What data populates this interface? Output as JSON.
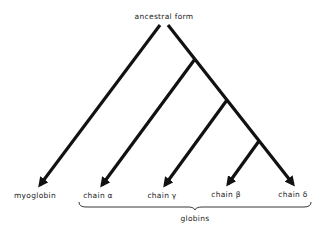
{
  "diagram": {
    "type": "phylogenetic-tree",
    "root": {
      "label": "ancestral form"
    },
    "leaves": [
      {
        "id": "myoglobin",
        "label": "myoglobin"
      },
      {
        "id": "alpha",
        "label": "chain α"
      },
      {
        "id": "gamma",
        "label": "chain γ"
      },
      {
        "id": "beta",
        "label": "chain β"
      },
      {
        "id": "delta",
        "label": "chain δ"
      }
    ],
    "group": {
      "label": "globins",
      "members": [
        "alpha",
        "gamma",
        "beta",
        "delta"
      ]
    },
    "colors": {
      "line": "#111111",
      "text": "#222222",
      "background": "#ffffff"
    }
  }
}
